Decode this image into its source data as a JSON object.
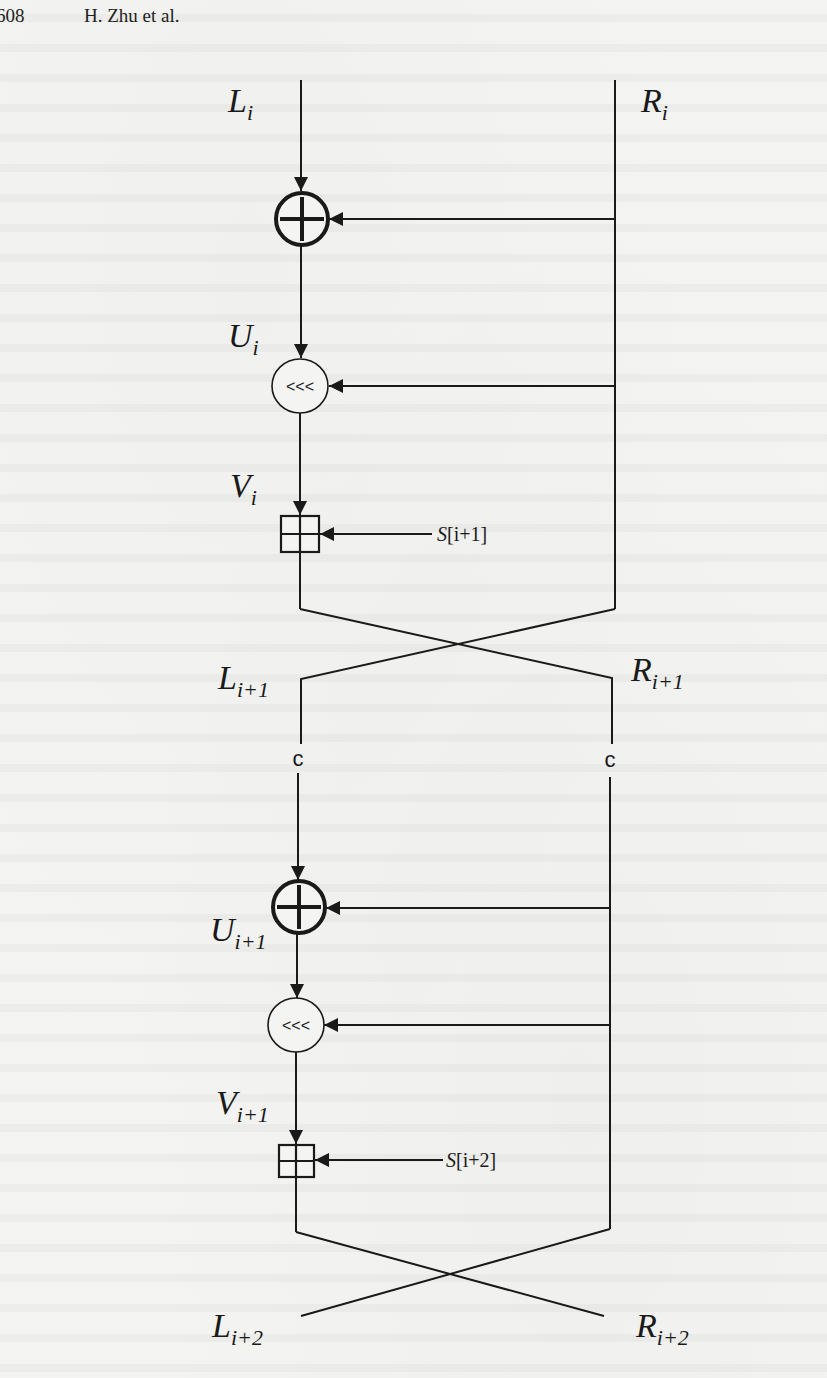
{
  "header": {
    "page_number": "608",
    "authors": "H. Zhu et al."
  },
  "figure": {
    "inputs": {
      "left": {
        "base": "L",
        "sub": "i"
      },
      "right": {
        "base": "R",
        "sub": "i"
      }
    },
    "round1": {
      "xor_output": {
        "base": "U",
        "sub": "i"
      },
      "rotate_symbol": "<<<",
      "rotate_output": {
        "base": "V",
        "sub": "i"
      },
      "subkey": {
        "base": "S",
        "index": "[i+1]"
      },
      "out_left": {
        "base": "L",
        "sub": "i+1"
      },
      "out_right": {
        "base": "R",
        "sub": "i+1"
      }
    },
    "transform_label_left": "c",
    "transform_label_right": "c",
    "round2": {
      "xor_output": {
        "base": "U",
        "sub": "i+1"
      },
      "rotate_symbol": "<<<",
      "rotate_output": {
        "base": "V",
        "sub": "i+1"
      },
      "subkey": {
        "base": "S",
        "index": "[i+2]"
      },
      "out_left": {
        "base": "L",
        "sub": "i+2"
      },
      "out_right": {
        "base": "R",
        "sub": "i+2"
      }
    },
    "operators": {
      "xor_icon": "circled-plus",
      "rotate_icon": "circle-left-rotate",
      "add_icon": "boxed-plus-modular-add"
    }
  }
}
